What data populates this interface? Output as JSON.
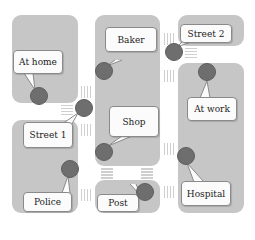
{
  "diagram": {
    "type": "city-map-location-graph",
    "colors": {
      "background": "#ffffff",
      "block": "#c6c6c6",
      "node": "#6e6e6e",
      "bubble": "#fbfbfb",
      "crosswalk": "#cfcfcf"
    },
    "locations": [
      {
        "id": "at_home",
        "label": "At home"
      },
      {
        "id": "baker",
        "label": "Baker"
      },
      {
        "id": "street_2",
        "label": "Street 2"
      },
      {
        "id": "at_work",
        "label": "At work"
      },
      {
        "id": "street_1",
        "label": "Street 1"
      },
      {
        "id": "shop",
        "label": "Shop"
      },
      {
        "id": "police",
        "label": "Police"
      },
      {
        "id": "post",
        "label": "Post"
      },
      {
        "id": "hospital",
        "label": "Hospital"
      }
    ]
  }
}
